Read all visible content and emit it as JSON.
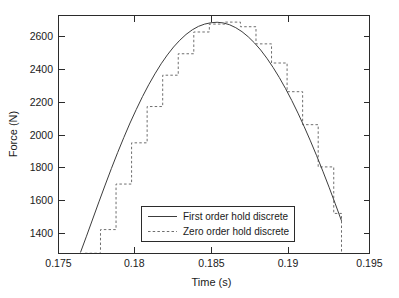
{
  "chart_data": {
    "type": "line",
    "title": "",
    "xlabel": "Time (s)",
    "ylabel": "Force (N)",
    "xlim": [
      0.175,
      0.195
    ],
    "ylim": [
      1300,
      2740
    ],
    "grid": false,
    "legend_position": "lower center",
    "xticks": [
      0.175,
      0.18,
      0.185,
      0.19,
      0.195
    ],
    "xtick_labels": [
      "0.175",
      "0.18",
      "0.185",
      "0.19",
      "0.195"
    ],
    "yticks": [
      1400,
      1600,
      1800,
      2000,
      2200,
      2400,
      2600
    ],
    "ytick_labels": [
      "1400",
      "1600",
      "1800",
      "2000",
      "2200",
      "2400",
      "2600"
    ],
    "series": [
      {
        "name": "First order hold discrete",
        "style": "solid",
        "color": "#3c3c3c",
        "x": [
          0.1764,
          0.1768,
          0.1772,
          0.1776,
          0.178,
          0.1784,
          0.1788,
          0.1792,
          0.1796,
          0.18,
          0.1804,
          0.1808,
          0.1812,
          0.1816,
          0.182,
          0.1824,
          0.1828,
          0.1832,
          0.1836,
          0.184,
          0.1844,
          0.1848,
          0.1852,
          0.1856,
          0.186,
          0.1864,
          0.1868,
          0.1872,
          0.1876,
          0.188,
          0.1884,
          0.1888,
          0.1892,
          0.1896,
          0.19,
          0.1904,
          0.1908,
          0.1912,
          0.1916,
          0.192,
          0.1924,
          0.1928,
          0.1932
        ],
        "y": [
          1300,
          1402,
          1506,
          1610,
          1712,
          1812,
          1908,
          2000,
          2088,
          2170,
          2248,
          2320,
          2386,
          2447,
          2501,
          2549,
          2590,
          2625,
          2653,
          2674,
          2688,
          2696,
          2699,
          2695,
          2684,
          2666,
          2642,
          2611,
          2574,
          2531,
          2481,
          2425,
          2364,
          2297,
          2225,
          2148,
          2066,
          1980,
          1890,
          1796,
          1699,
          1598,
          1495
        ]
      },
      {
        "name": "Zero order hold discrete",
        "style": "dashed",
        "color": "#6e6e6e",
        "step": "post",
        "sample_interval": 0.001,
        "x": [
          0.1767,
          0.1777,
          0.1787,
          0.1797,
          0.1807,
          0.1817,
          0.1827,
          0.1837,
          0.1847,
          0.1857,
          0.1867,
          0.1877,
          0.1887,
          0.1897,
          0.1907,
          0.1917,
          0.1927,
          0.1932
        ],
        "y": [
          1300,
          1442,
          1718,
          1968,
          2188,
          2378,
          2508,
          2640,
          2688,
          2700,
          2672,
          2568,
          2452,
          2278,
          2078,
          1822,
          1540,
          1300
        ]
      }
    ]
  },
  "axes": {
    "ylabel": "Force (N)",
    "xlabel": "Time (s)"
  },
  "legend": {
    "entries": [
      {
        "label": "First order hold discrete",
        "style": "solid"
      },
      {
        "label": "Zero order hold discrete",
        "style": "dashed"
      }
    ]
  },
  "colors": {
    "background": "#ffffff",
    "axis": "#2b2b2b",
    "first_order": "#3c3c3c",
    "zero_order": "#6e6e6e"
  }
}
